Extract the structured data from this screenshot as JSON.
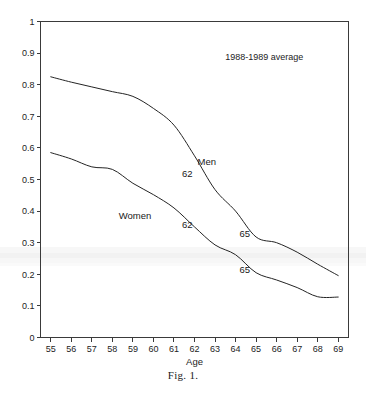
{
  "figure": {
    "caption": "Fig. 1.",
    "annotation_note": "1988-1989 average"
  },
  "chart_data": {
    "type": "line",
    "title": "",
    "subtitle": "",
    "xlabel": "Age",
    "ylabel": "",
    "xlim": [
      54.5,
      69.5
    ],
    "ylim": [
      0,
      1
    ],
    "grid": false,
    "legend_position": "inline-labels",
    "x_ticks": [
      55,
      56,
      57,
      58,
      59,
      60,
      61,
      62,
      63,
      64,
      65,
      66,
      67,
      68,
      69
    ],
    "x_tick_labels": [
      "55",
      "56",
      "57",
      "58",
      "59",
      "60",
      "61",
      "62",
      "63",
      "64",
      "65",
      "66",
      "67",
      "68",
      "69"
    ],
    "y_ticks": [
      0,
      0.1,
      0.2,
      0.3,
      0.4,
      0.5,
      0.6,
      0.7,
      0.8,
      0.9,
      1
    ],
    "y_tick_labels": [
      "0",
      "0.1",
      "0.2",
      "0.3",
      "0.4",
      "0.5",
      "0.6",
      "0.7",
      "0.8",
      "0.9",
      "1"
    ],
    "x": [
      55,
      56,
      57,
      58,
      59,
      60,
      61,
      62,
      63,
      64,
      65,
      66,
      67,
      68,
      69
    ],
    "series": [
      {
        "name": "Men",
        "label": "Men",
        "label_x": 62.6,
        "label_y": 0.545,
        "values": [
          0.825,
          0.808,
          0.793,
          0.778,
          0.763,
          0.725,
          0.672,
          0.575,
          0.468,
          0.4,
          0.318,
          0.3,
          0.27,
          0.232,
          0.196
        ]
      },
      {
        "name": "Women",
        "label": "Women",
        "label_x": 59.1,
        "label_y": 0.375,
        "values": [
          0.585,
          0.565,
          0.54,
          0.532,
          0.488,
          0.452,
          0.41,
          0.35,
          0.293,
          0.262,
          0.205,
          0.182,
          0.158,
          0.129,
          0.128
        ]
      }
    ],
    "annotations": [
      {
        "text": "62",
        "series": "Men",
        "x": 61.65,
        "y": 0.508
      },
      {
        "text": "62",
        "series": "Women",
        "x": 61.65,
        "y": 0.345
      },
      {
        "text": "65",
        "series": "Men",
        "x": 64.45,
        "y": 0.318
      },
      {
        "text": "65",
        "series": "Women",
        "x": 64.45,
        "y": 0.205
      }
    ],
    "note": {
      "text": "1988-1989 average",
      "x": 65.4,
      "y": 0.878
    }
  },
  "colors": {
    "line": "#242424",
    "axis": "#3a3a3a",
    "text": "#232323",
    "background": "#ffffff"
  }
}
